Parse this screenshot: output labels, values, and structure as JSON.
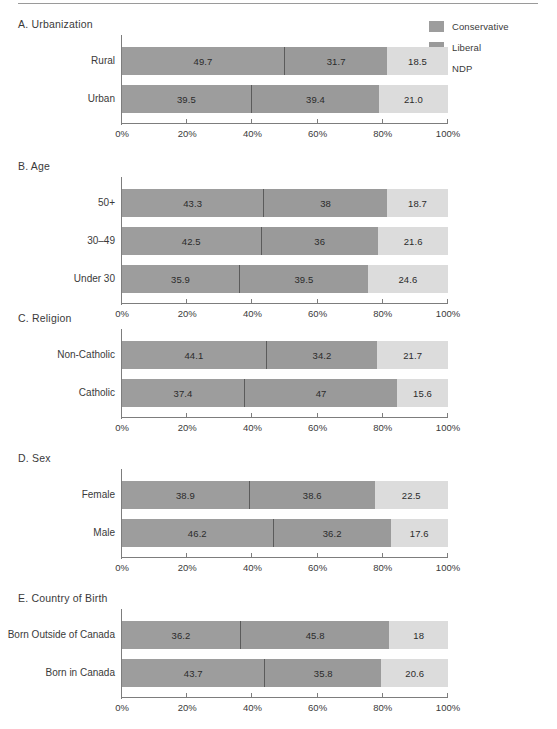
{
  "legend": {
    "items": [
      {
        "label": "Conservative",
        "color": "#9d9d9d",
        "key": "conservative"
      },
      {
        "label": "Liberal",
        "color": "#9a9a9a",
        "key": "liberal"
      },
      {
        "label": "NDP",
        "color": "#dcdcdc",
        "key": "ndp"
      }
    ]
  },
  "axis": {
    "ticks": [
      "0%",
      "20%",
      "40%",
      "60%",
      "80%",
      "100%"
    ],
    "min": 0,
    "max": 100
  },
  "chart_data": {
    "type": "bar",
    "orientation": "horizontal",
    "stacked": true,
    "normalized_percent": true,
    "xlabel": "",
    "ylabel": "",
    "xlim": [
      0,
      100
    ],
    "xticks": [
      0,
      20,
      40,
      60,
      80,
      100
    ],
    "xtick_labels": [
      "0%",
      "20%",
      "40%",
      "60%",
      "80%",
      "100%"
    ],
    "grid": false,
    "legend_position": "top-right",
    "series": [
      {
        "name": "Conservative",
        "color": "#9d9d9d"
      },
      {
        "name": "Liberal",
        "color": "#9a9a9a"
      },
      {
        "name": "NDP",
        "color": "#dcdcdc"
      }
    ],
    "panels": [
      {
        "title": "A. Urbanization",
        "categories": [
          "Rural",
          "Urban"
        ],
        "rows": [
          {
            "label": "Rural",
            "values": [
              49.7,
              31.7,
              18.5
            ],
            "display": [
              "49.7",
              "31.7",
              "18.5"
            ]
          },
          {
            "label": "Urban",
            "values": [
              39.5,
              39.4,
              21.0
            ],
            "display": [
              "39.5",
              "39.4",
              "21.0"
            ]
          }
        ]
      },
      {
        "title": "B. Age",
        "categories": [
          "50+",
          "30–49",
          "Under 30"
        ],
        "rows": [
          {
            "label": "50+",
            "values": [
              43.3,
              38,
              18.7
            ],
            "display": [
              "43.3",
              "38",
              "18.7"
            ]
          },
          {
            "label": "30–49",
            "values": [
              42.5,
              36,
              21.6
            ],
            "display": [
              "42.5",
              "36",
              "21.6"
            ]
          },
          {
            "label": "Under 30",
            "values": [
              35.9,
              39.5,
              24.6
            ],
            "display": [
              "35.9",
              "39.5",
              "24.6"
            ]
          }
        ]
      },
      {
        "title": "C. Religion",
        "categories": [
          "Non-Catholic",
          "Catholic"
        ],
        "rows": [
          {
            "label": "Non-Catholic",
            "values": [
              44.1,
              34.2,
              21.7
            ],
            "display": [
              "44.1",
              "34.2",
              "21.7"
            ]
          },
          {
            "label": "Catholic",
            "values": [
              37.4,
              47,
              15.6
            ],
            "display": [
              "37.4",
              "47",
              "15.6"
            ]
          }
        ]
      },
      {
        "title": "D. Sex",
        "categories": [
          "Female",
          "Male"
        ],
        "rows": [
          {
            "label": "Female",
            "values": [
              38.9,
              38.6,
              22.5
            ],
            "display": [
              "38.9",
              "38.6",
              "22.5"
            ]
          },
          {
            "label": "Male",
            "values": [
              46.2,
              36.2,
              17.6
            ],
            "display": [
              "46.2",
              "36.2",
              "17.6"
            ]
          }
        ]
      },
      {
        "title": "E. Country of Birth",
        "categories": [
          "Born Outside of Canada",
          "Born in Canada"
        ],
        "rows": [
          {
            "label": "Born Outside of Canada",
            "values": [
              36.2,
              45.8,
              18
            ],
            "display": [
              "36.2",
              "45.8",
              "18"
            ]
          },
          {
            "label": "Born in Canada",
            "values": [
              43.7,
              35.8,
              20.6
            ],
            "display": [
              "43.7",
              "35.8",
              "20.6"
            ]
          }
        ]
      }
    ]
  },
  "layout": {
    "panel_tops": [
      18,
      160,
      312,
      452,
      592
    ],
    "plot_left": 122,
    "plot_width": 326,
    "bar_height": 28,
    "bar_gap": 10,
    "first_bar_offset": 12
  }
}
